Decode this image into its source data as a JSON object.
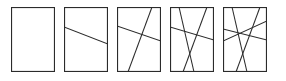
{
  "figure": {
    "name": "line-arrangement-sequence",
    "background_color": "#ffffff",
    "stroke_color": "#2b2b2b",
    "panel_count": 5,
    "panel_width": 44,
    "panel_height": 65,
    "panel_top": 7,
    "panel_gap": 9,
    "panel_lefts": [
      11,
      64,
      117,
      170,
      223
    ]
  },
  "panels": [
    {
      "id": "panel-1",
      "label": "0",
      "line_count": 0,
      "lines": []
    },
    {
      "id": "panel-2",
      "label": "1",
      "line_count": 1,
      "lines": [
        {
          "id": "line-a",
          "x1": 0,
          "y1": 20,
          "x2": 44,
          "y2": 37
        }
      ]
    },
    {
      "id": "panel-3",
      "label": "2",
      "line_count": 2,
      "lines": [
        {
          "id": "line-a",
          "x1": 0,
          "y1": 19,
          "x2": 44,
          "y2": 34
        },
        {
          "id": "line-b",
          "x1": 11,
          "y1": 65,
          "x2": 35,
          "y2": 0
        }
      ]
    },
    {
      "id": "panel-4",
      "label": "3",
      "line_count": 3,
      "lines": [
        {
          "id": "line-a",
          "x1": 0,
          "y1": 20,
          "x2": 44,
          "y2": 33
        },
        {
          "id": "line-b",
          "x1": 13,
          "y1": 65,
          "x2": 37,
          "y2": 0
        },
        {
          "id": "line-c",
          "x1": 9,
          "y1": 0,
          "x2": 24,
          "y2": 65
        }
      ]
    },
    {
      "id": "panel-5",
      "label": "4",
      "line_count": 4,
      "lines": [
        {
          "id": "line-a",
          "x1": 0,
          "y1": 22,
          "x2": 44,
          "y2": 33
        },
        {
          "id": "line-b",
          "x1": 13,
          "y1": 65,
          "x2": 37,
          "y2": 0
        },
        {
          "id": "line-c",
          "x1": 9,
          "y1": 0,
          "x2": 24,
          "y2": 65
        },
        {
          "id": "line-d",
          "x1": 0,
          "y1": 34,
          "x2": 44,
          "y2": 14
        }
      ]
    }
  ],
  "chart_data": {
    "type": "diagram",
    "title": "",
    "categories": [
      "0 lines",
      "1 line",
      "2 lines",
      "3 lines",
      "4 lines"
    ],
    "values": [
      0,
      1,
      2,
      3,
      4
    ],
    "xlabel": "",
    "ylabel": ""
  }
}
